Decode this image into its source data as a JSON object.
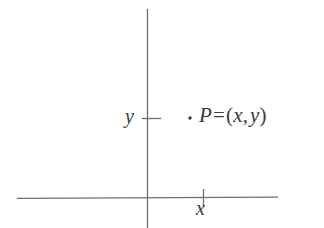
{
  "figure": {
    "type": "cartesian-coordinate-diagram",
    "background_color": "#ffffff",
    "line_color": "#6e6e73",
    "text_color": "#3b3b3b",
    "width": 324,
    "height": 228
  },
  "axes": {
    "x_axis": {
      "name": "x-axis",
      "orientation": "horizontal",
      "y_position": 198,
      "x_start": 17,
      "x_end": 278
    },
    "y_axis": {
      "name": "y-axis",
      "orientation": "vertical",
      "x_position": 147,
      "y_start": 9,
      "y_end": 228
    }
  },
  "ticks": {
    "x_tick": {
      "label": "x",
      "x_position": 203,
      "y_top": 189,
      "y_bottom": 207
    },
    "y_tick": {
      "label": "y",
      "y_position": 118,
      "x_left": 142,
      "x_right": 161
    }
  },
  "point": {
    "marker": "·",
    "x": 190,
    "y": 118,
    "label_parts": {
      "name": "P",
      "equals": "=",
      "open_paren": "(",
      "x_coord": "x",
      "comma": ",",
      "y_coord": "y",
      "close_paren": ")"
    },
    "label_full": "P = (x, y)"
  }
}
